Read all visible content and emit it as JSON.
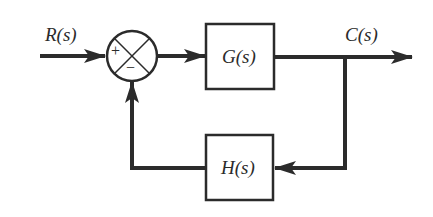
{
  "diagram": {
    "type": "negative feedback control loop",
    "input_label": "R(s)",
    "output_label": "C(s)",
    "forward_block": "G(s)",
    "feedback_block": "H(s)",
    "summing_junction": {
      "plus_sign": "+",
      "minus_sign": "−"
    },
    "colors": {
      "line": "#2b2b2b",
      "background": "#ffffff"
    }
  }
}
